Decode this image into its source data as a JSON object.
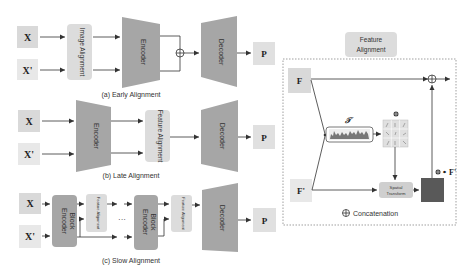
{
  "panels": {
    "early": {
      "caption": "(a) Early Alignment",
      "input_x": "X",
      "input_x_prime": "X'",
      "alignment_label": "Image Alignment",
      "encoder_label": "Encoder",
      "decoder_label": "Decoder",
      "output": "P"
    },
    "late": {
      "caption": "(b) Late Alignment",
      "input_x": "X",
      "input_x_prime": "X'",
      "encoder_label": "Encoder",
      "alignment_label": "Feature Alignment",
      "decoder_label": "Decoder",
      "output": "P"
    },
    "slow": {
      "caption": "(c) Slow Alignment",
      "input_x": "X",
      "input_x_prime": "X'",
      "block1_label": "Encoder Block",
      "block2_label": "Encoder Block",
      "alignment1_label": "Feature Alignment",
      "alignment2_label": "Feature Alignment",
      "ellipsis": "···",
      "decoder_label": "Decoder",
      "output": "P"
    }
  },
  "feature_alignment": {
    "title_line1": "Feature",
    "title_line2": "Alignment",
    "input_f": "F",
    "input_f_prime": "F'",
    "transformer_label": "𝒯",
    "phi_label": "Φ",
    "spatial_line1": "Spatial",
    "spatial_line2": "Transform",
    "output_label": "Φ ∘ F'",
    "legend": "Concatenation"
  },
  "colors": {
    "input_box": "#d9d9d9",
    "input_box_light": "#e6e6e6",
    "encoder": "#a6a6a6",
    "align_box": "#dcdcdc",
    "dark_block": "#595959",
    "line": "#333333"
  }
}
